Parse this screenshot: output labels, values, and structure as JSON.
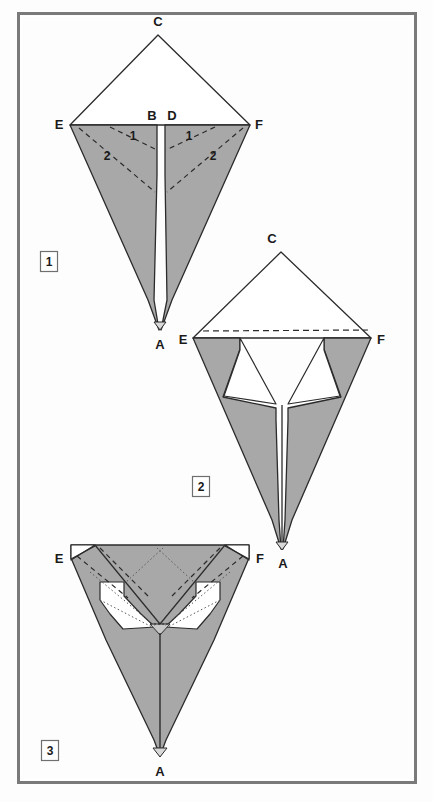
{
  "figure": {
    "background_color": "#fdfdfd",
    "frame_color": "#7a7a7a",
    "paper_fill": "#a8a8a8",
    "paper_back_fill": "#ffffff",
    "line_color": "#2b2b2b"
  },
  "steps": [
    {
      "badge": "1",
      "badge_x": 40,
      "badge_y": 251
    },
    {
      "badge": "2",
      "badge_x": 192,
      "badge_y": 476
    },
    {
      "badge": "3",
      "badge_x": 41,
      "badge_y": 740
    }
  ],
  "step1": {
    "name": "step-1-kite-with-creases",
    "vertex_labels": [
      {
        "id": "C",
        "text": "C",
        "x": 158,
        "y": 26
      },
      {
        "id": "E",
        "text": "E",
        "x": 59,
        "y": 129
      },
      {
        "id": "B",
        "text": "B",
        "x": 152,
        "y": 122
      },
      {
        "id": "D",
        "text": "D",
        "x": 172,
        "y": 122
      },
      {
        "id": "F",
        "text": "F",
        "x": 259,
        "y": 129
      },
      {
        "id": "A",
        "text": "A",
        "x": 160,
        "y": 349
      }
    ],
    "crease_labels": [
      {
        "text": "1",
        "x": 133,
        "y": 136
      },
      {
        "text": "2",
        "x": 108,
        "y": 156
      },
      {
        "text": "1",
        "x": 188,
        "y": 136
      },
      {
        "text": "2",
        "x": 212,
        "y": 158
      }
    ]
  },
  "step2": {
    "name": "step-2-flaps-folded",
    "vertex_labels": [
      {
        "id": "C",
        "text": "C",
        "x": 272,
        "y": 241
      },
      {
        "id": "E",
        "text": "E",
        "x": 182,
        "y": 344
      },
      {
        "id": "F",
        "text": "F",
        "x": 380,
        "y": 344
      },
      {
        "id": "A",
        "text": "A",
        "x": 281,
        "y": 565
      }
    ]
  },
  "step3": {
    "name": "step-3-top-folded-down",
    "vertex_labels": [
      {
        "id": "E",
        "text": "E",
        "x": 58,
        "y": 559
      },
      {
        "id": "F",
        "text": "F",
        "x": 257,
        "y": 559
      },
      {
        "id": "A",
        "text": "A",
        "x": 160,
        "y": 775
      }
    ]
  }
}
